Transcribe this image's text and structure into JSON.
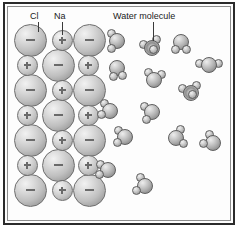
{
  "figure": {
    "background_color": "#fdfdfd",
    "frame_color": "#2b2b2b",
    "inner_frame_color": "#8d8d8d"
  },
  "labels": [
    {
      "id": "cl",
      "text": "Cl",
      "x": 30,
      "y": 11,
      "leader_x": 38,
      "leader_top": 22,
      "leader_height": 10
    },
    {
      "id": "na",
      "text": "Na",
      "x": 54,
      "y": 11,
      "leader_x": 62,
      "leader_top": 22,
      "leader_height": 13
    },
    {
      "id": "water",
      "text": "Water molecule",
      "x": 113,
      "y": 11,
      "leader_x": 153,
      "leader_top": 22,
      "leader_height": 19
    }
  ],
  "lattice": {
    "description": "Alternating chloride (minus) and sodium (plus) ions in a 3-column, 7-row staggered lattice",
    "anion_label": "Cl",
    "cation_label": "Na",
    "anion_charge": "−",
    "cation_charge": "+",
    "anion_diameter": 33,
    "cation_diameter": 21,
    "ions": [
      {
        "charge": "minus",
        "cx": 30,
        "cy": 40
      },
      {
        "charge": "plus",
        "cx": 62,
        "cy": 40
      },
      {
        "charge": "minus",
        "cx": 89,
        "cy": 40
      },
      {
        "charge": "plus",
        "cx": 27,
        "cy": 65
      },
      {
        "charge": "minus",
        "cx": 58,
        "cy": 65
      },
      {
        "charge": "plus",
        "cx": 88,
        "cy": 65
      },
      {
        "charge": "minus",
        "cx": 30,
        "cy": 90
      },
      {
        "charge": "plus",
        "cx": 62,
        "cy": 90
      },
      {
        "charge": "minus",
        "cx": 89,
        "cy": 90
      },
      {
        "charge": "plus",
        "cx": 27,
        "cy": 115
      },
      {
        "charge": "minus",
        "cx": 58,
        "cy": 115
      },
      {
        "charge": "plus",
        "cx": 88,
        "cy": 115
      },
      {
        "charge": "minus",
        "cx": 30,
        "cy": 140
      },
      {
        "charge": "plus",
        "cx": 62,
        "cy": 140
      },
      {
        "charge": "minus",
        "cx": 89,
        "cy": 140
      },
      {
        "charge": "plus",
        "cx": 27,
        "cy": 165
      },
      {
        "charge": "minus",
        "cx": 58,
        "cy": 165
      },
      {
        "charge": "plus",
        "cx": 88,
        "cy": 165
      },
      {
        "charge": "minus",
        "cx": 30,
        "cy": 190
      },
      {
        "charge": "plus",
        "cx": 62,
        "cy": 190
      },
      {
        "charge": "minus",
        "cx": 89,
        "cy": 190
      }
    ]
  },
  "water_molecules": {
    "description": "Free water molecules, each an oxygen sphere with two hydrogen spheres",
    "oxygen_diameter": 16,
    "hydrogen_diameter": 9,
    "items": [
      {
        "cx": 117,
        "cy": 41,
        "style": "normal",
        "h1": 128,
        "h2": 232,
        "rot": 0
      },
      {
        "cx": 152,
        "cy": 48,
        "style": "ring",
        "h1": 200,
        "h2": 300,
        "rot": 0
      },
      {
        "cx": 181,
        "cy": 42,
        "style": "normal",
        "h1": 55,
        "h2": 125,
        "rot": 0
      },
      {
        "cx": 117,
        "cy": 68,
        "style": "normal",
        "h1": 50,
        "h2": 115,
        "rot": 0
      },
      {
        "cx": 209,
        "cy": 65,
        "style": "normal",
        "h1": 190,
        "h2": 350,
        "rot": 0
      },
      {
        "cx": 154,
        "cy": 80,
        "style": "normal",
        "h1": 230,
        "h2": 320,
        "rot": 0
      },
      {
        "cx": 191,
        "cy": 93,
        "style": "ring",
        "h1": 210,
        "h2": 310,
        "rot": 0
      },
      {
        "cx": 110,
        "cy": 111,
        "style": "normal",
        "h1": 160,
        "h2": 235,
        "rot": 0
      },
      {
        "cx": 152,
        "cy": 112,
        "style": "normal",
        "h1": 125,
        "h2": 215,
        "rot": 0
      },
      {
        "cx": 125,
        "cy": 137,
        "style": "normal",
        "h1": 145,
        "h2": 225,
        "rot": 0
      },
      {
        "cx": 176,
        "cy": 138,
        "style": "normal",
        "h1": 35,
        "h2": 300,
        "rot": 0
      },
      {
        "cx": 213,
        "cy": 143,
        "style": "normal",
        "h1": 175,
        "h2": 245,
        "rot": 0
      },
      {
        "cx": 108,
        "cy": 170,
        "style": "normal",
        "h1": 150,
        "h2": 215,
        "rot": 0
      },
      {
        "cx": 145,
        "cy": 186,
        "style": "normal",
        "h1": 150,
        "h2": 240,
        "rot": 0
      }
    ]
  }
}
